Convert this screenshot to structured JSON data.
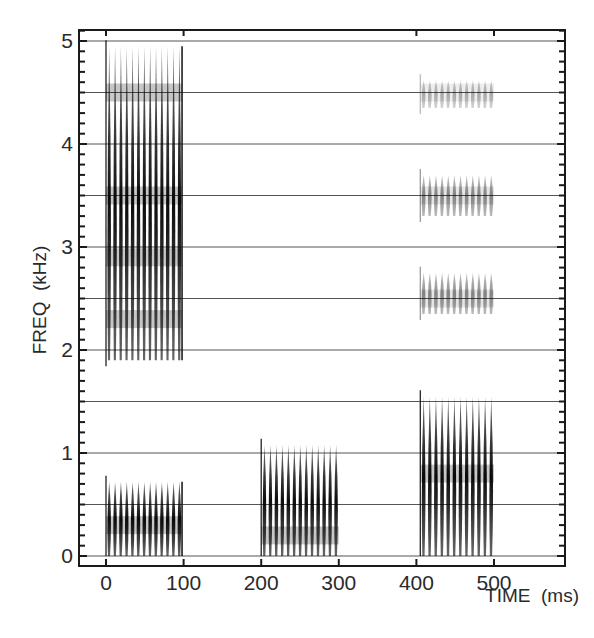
{
  "chart_data": {
    "type": "heatmap",
    "subtype": "spectrogram",
    "title": "",
    "xlabel": "TIME  (ms)",
    "ylabel": "FREQ  (kHz)",
    "xlim": [
      -12,
      590
    ],
    "ylim": [
      -0.1,
      5.1
    ],
    "x_ticks": [
      0,
      100,
      200,
      300,
      400,
      500
    ],
    "x_tick_labels": [
      "0",
      "100",
      "200",
      "300",
      "400",
      "500"
    ],
    "y_ticks": [
      0,
      1,
      2,
      3,
      4,
      5
    ],
    "y_tick_labels": [
      "0",
      "1",
      "2",
      "3",
      "4",
      "5"
    ],
    "y_minor_tick_step": 0.1,
    "grid": {
      "horizontal": true,
      "step_khz": 0.5,
      "vertical": false
    },
    "legend": null,
    "bursts": [
      {
        "name": "burst-1-high",
        "t_start": 0,
        "t_end": 98,
        "f_low": 1.9,
        "f_high": 4.95,
        "pulses": 13,
        "intensity": "dark",
        "dense_bands_khz": [
          2.3,
          2.9,
          3.5,
          4.5
        ]
      },
      {
        "name": "burst-1-low",
        "t_start": 0,
        "t_end": 98,
        "f_low": 0.0,
        "f_high": 0.72,
        "pulses": 13,
        "intensity": "dark",
        "dense_bands_khz": [
          0.3
        ]
      },
      {
        "name": "burst-2",
        "t_start": 200,
        "t_end": 300,
        "f_low": 0.0,
        "f_high": 1.08,
        "pulses": 13,
        "intensity": "dark",
        "dense_bands_khz": [
          0.2
        ]
      },
      {
        "name": "burst-3-low",
        "t_start": 405,
        "t_end": 500,
        "f_low": 0.0,
        "f_high": 1.55,
        "pulses": 12,
        "intensity": "dark",
        "dense_bands_khz": [
          0.8
        ]
      },
      {
        "name": "burst-3-h2",
        "t_start": 405,
        "t_end": 500,
        "f_low": 2.35,
        "f_high": 2.75,
        "pulses": 12,
        "intensity": "light",
        "dense_bands_khz": [
          2.5
        ]
      },
      {
        "name": "burst-3-h3",
        "t_start": 405,
        "t_end": 500,
        "f_low": 3.3,
        "f_high": 3.7,
        "pulses": 12,
        "intensity": "light",
        "dense_bands_khz": [
          3.5
        ]
      },
      {
        "name": "burst-3-h4",
        "t_start": 405,
        "t_end": 500,
        "f_low": 4.35,
        "f_high": 4.62,
        "pulses": 12,
        "intensity": "faint",
        "dense_bands_khz": [
          4.5
        ]
      }
    ],
    "colors": {
      "background": "#ffffff",
      "ink": "#1a1a1a",
      "grid": "#555555"
    }
  }
}
